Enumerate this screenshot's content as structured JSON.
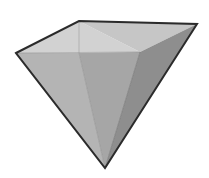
{
  "scene": {
    "title": "Inverted pyramid gem",
    "description": "Shaded 3D inverted four-sided pyramid (gem / diamond) rendered in grayscale on a white background",
    "background_color": "#ffffff",
    "canvas": {
      "width": 209,
      "height": 178
    }
  },
  "shape": {
    "name": "inverted-pyramid-gem",
    "apex": {
      "x": 105,
      "y": 168
    },
    "vertices": {
      "left": {
        "x": 16,
        "y": 53
      },
      "top_near_left": {
        "x": 79,
        "y": 21
      },
      "right": {
        "x": 197,
        "y": 24
      },
      "front": {
        "x": 140,
        "y": 52
      }
    },
    "outline_color": "#2b2b2b",
    "outline_width": 2
  },
  "faces": [
    {
      "id": "top-face-left",
      "label": "Top face (left half)",
      "fill": "#d2d2d2",
      "points": "16,53 79,21 140,52"
    },
    {
      "id": "top-face-right",
      "label": "Top face (right half)",
      "fill": "#c6c6c6",
      "points": "79,21 197,24 140,52"
    },
    {
      "id": "side-face-left",
      "label": "Left side face",
      "fill": "#b4b4b4",
      "points": "16,53 79,53 105,168"
    },
    {
      "id": "side-face-center",
      "label": "Center front face",
      "fill": "#a6a6a6",
      "points": "79,53 140,52 105,168"
    },
    {
      "id": "side-face-right",
      "label": "Right side face",
      "fill": "#8e8e8e",
      "points": "140,52 197,24 105,168"
    }
  ],
  "inner_edges": [
    {
      "id": "edge-left-crease",
      "label": "Left crease edge",
      "from": "79,21",
      "to": "79,53",
      "color": "#9a9a9a"
    },
    {
      "id": "edge-top-horizontal",
      "label": "Top horizontal girdle edge",
      "from": "16,53",
      "to": "140,52",
      "color": "#8d8d8d"
    },
    {
      "id": "edge-left-to-apex",
      "label": "Left crease to apex",
      "from": "79,53",
      "to": "105,168",
      "color": "#8d8d8d"
    },
    {
      "id": "edge-front-to-apex",
      "label": "Front vertex to apex",
      "from": "140,52",
      "to": "105,168",
      "color": "#6e6e6e"
    }
  ],
  "chart_data": {
    "type": "scatter",
    "xlabel": "x (px)",
    "ylabel": "y (px)",
    "xlim": [
      0,
      209
    ],
    "ylim": [
      0,
      178
    ],
    "x": [
      16,
      79,
      197,
      140,
      105,
      79
    ],
    "y": [
      53,
      21,
      24,
      52,
      168,
      53
    ],
    "labels": [
      "left",
      "top-near-left",
      "right",
      "front",
      "apex",
      "left-crease-base"
    ]
  }
}
